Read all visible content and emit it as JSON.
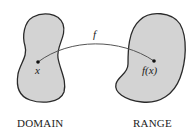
{
  "diagram": {
    "type": "function-mapping",
    "domain": {
      "label": "DOMAIN",
      "point_label": "x"
    },
    "range": {
      "label": "RANGE",
      "point_label": "f(x)"
    },
    "arrow": {
      "label": "f",
      "from": "x",
      "to": "f(x)"
    },
    "colors": {
      "fill": "#d3d3d3",
      "stroke": "#2a2a2a",
      "line": "#555555"
    }
  }
}
